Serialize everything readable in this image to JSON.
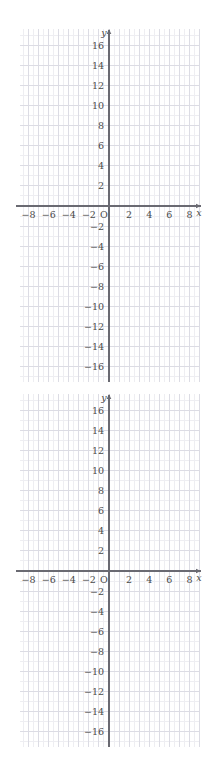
{
  "page": {
    "background_color": "#ffffff",
    "figure_count": 2
  },
  "style": {
    "minor_grid_color": "#eeeef2",
    "major_grid_color": "#dcdce4",
    "axis_color": "#6a6a72",
    "label_color": "#4a4a4a"
  },
  "chart_data": [
    {
      "type": "scatter",
      "title": "",
      "subtitle": "",
      "xlabel": "x",
      "ylabel": "y",
      "xlim": [
        -9,
        9.5
      ],
      "ylim": [
        -17,
        17
      ],
      "x_ticks": [
        -8,
        -6,
        -4,
        -2,
        2,
        4,
        6,
        8
      ],
      "x_tick_labels": [
        "−8",
        "−6",
        "−4",
        "−2",
        "2",
        "4",
        "6",
        "8"
      ],
      "y_ticks": [
        16,
        14,
        12,
        10,
        8,
        6,
        4,
        2,
        -2,
        -4,
        -6,
        -8,
        -10,
        -12,
        -14,
        -16
      ],
      "y_tick_labels": [
        "16",
        "14",
        "12",
        "10",
        "8",
        "6",
        "4",
        "2",
        "−2",
        "−4",
        "−6",
        "−8",
        "−10",
        "−12",
        "−14",
        "−16"
      ],
      "origin_label": "O",
      "grid": true,
      "minor_grid": true,
      "x_major_step": 1,
      "y_major_step": 2,
      "x_minor_step": 0.5,
      "y_minor_step": 1,
      "legend": null,
      "series": [],
      "annotations": [],
      "arrows": [
        "x-positive",
        "y-positive"
      ]
    },
    {
      "type": "scatter",
      "title": "",
      "subtitle": "",
      "xlabel": "x",
      "ylabel": "y",
      "xlim": [
        -9,
        9.5
      ],
      "ylim": [
        -17,
        17
      ],
      "x_ticks": [
        -8,
        -6,
        -4,
        -2,
        2,
        4,
        6,
        8
      ],
      "x_tick_labels": [
        "−8",
        "−6",
        "−4",
        "−2",
        "2",
        "4",
        "6",
        "8"
      ],
      "y_ticks": [
        16,
        14,
        12,
        10,
        8,
        6,
        4,
        2,
        -2,
        -4,
        -6,
        -8,
        -10,
        -12,
        -14,
        -16
      ],
      "y_tick_labels": [
        "16",
        "14",
        "12",
        "10",
        "8",
        "6",
        "4",
        "2",
        "−2",
        "−4",
        "−6",
        "−8",
        "−10",
        "−12",
        "−14",
        "−16"
      ],
      "origin_label": "O",
      "grid": true,
      "minor_grid": true,
      "x_major_step": 1,
      "y_major_step": 2,
      "x_minor_step": 0.5,
      "y_minor_step": 1,
      "legend": null,
      "series": [],
      "annotations": [],
      "arrows": [
        "x-positive",
        "y-positive"
      ]
    }
  ]
}
